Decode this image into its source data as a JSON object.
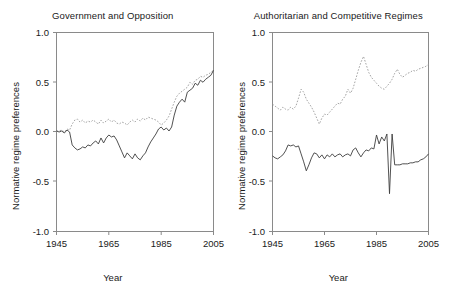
{
  "figure": {
    "xlabel": "Year",
    "ylabel": "Normative regime preferences"
  },
  "chart_data": [
    {
      "type": "line",
      "title": "Government and Opposition",
      "xlabel": "Year",
      "ylabel": "Normative regime preferences",
      "xlim": [
        1945,
        2005
      ],
      "ylim": [
        -1.0,
        1.0
      ],
      "xticks": [
        1945,
        1965,
        1985,
        2005
      ],
      "yticks": [
        -1.0,
        -0.5,
        0.0,
        0.5,
        1.0
      ],
      "xtick_labels": [
        "1945",
        "1965",
        "1985",
        "2005"
      ],
      "ytick_labels": [
        "-1.0",
        "-0.5",
        "0.0",
        "0.5",
        "1.0"
      ],
      "grid": false,
      "legend": "none",
      "x": [
        1945,
        1946,
        1947,
        1948,
        1949,
        1950,
        1951,
        1952,
        1953,
        1954,
        1955,
        1956,
        1957,
        1958,
        1959,
        1960,
        1961,
        1962,
        1963,
        1964,
        1965,
        1966,
        1967,
        1968,
        1969,
        1970,
        1971,
        1972,
        1973,
        1974,
        1975,
        1976,
        1977,
        1978,
        1979,
        1980,
        1981,
        1982,
        1983,
        1984,
        1985,
        1986,
        1987,
        1988,
        1989,
        1990,
        1991,
        1992,
        1993,
        1994,
        1995,
        1996,
        1997,
        1998,
        1999,
        2000,
        2001,
        2002,
        2003,
        2004,
        2005
      ],
      "series": [
        {
          "name": "Government (solid)",
          "style": "solid",
          "values": [
            0.01,
            0.0,
            0.01,
            -0.01,
            0.02,
            0.0,
            -0.13,
            -0.16,
            -0.18,
            -0.17,
            -0.15,
            -0.16,
            -0.13,
            -0.14,
            -0.11,
            -0.09,
            -0.12,
            -0.06,
            -0.11,
            -0.06,
            -0.03,
            -0.05,
            -0.04,
            -0.08,
            -0.14,
            -0.2,
            -0.26,
            -0.21,
            -0.24,
            -0.27,
            -0.22,
            -0.26,
            -0.28,
            -0.24,
            -0.21,
            -0.15,
            -0.1,
            -0.06,
            -0.02,
            0.03,
            0.05,
            0.02,
            0.04,
            0.01,
            0.05,
            0.17,
            0.26,
            0.3,
            0.33,
            0.3,
            0.4,
            0.42,
            0.44,
            0.49,
            0.47,
            0.52,
            0.5,
            0.53,
            0.55,
            0.57,
            0.62
          ]
        },
        {
          "name": "Opposition (dotted)",
          "style": "dotted",
          "values": [
            0.01,
            0.01,
            0.02,
            0.0,
            0.03,
            0.02,
            0.08,
            0.12,
            0.13,
            0.1,
            0.12,
            0.09,
            0.11,
            0.1,
            0.12,
            0.1,
            0.08,
            0.12,
            0.09,
            0.11,
            0.13,
            0.1,
            0.12,
            0.09,
            0.08,
            0.1,
            0.09,
            0.07,
            0.1,
            0.12,
            0.1,
            0.13,
            0.11,
            0.14,
            0.12,
            0.15,
            0.14,
            0.13,
            0.12,
            0.1,
            0.07,
            0.09,
            0.12,
            0.16,
            0.23,
            0.3,
            0.36,
            0.39,
            0.41,
            0.43,
            0.45,
            0.5,
            0.48,
            0.52,
            0.53,
            0.56,
            0.55,
            0.57,
            0.58,
            0.6,
            0.62
          ]
        }
      ]
    },
    {
      "type": "line",
      "title": "Authoritarian and Competitive Regimes",
      "xlabel": "Year",
      "ylabel": "Normative regime preferences",
      "xlim": [
        1945,
        2005
      ],
      "ylim": [
        -1.0,
        1.0
      ],
      "xticks": [
        1945,
        1965,
        1985,
        2005
      ],
      "yticks": [
        -1.0,
        -0.5,
        0.0,
        0.5,
        1.0
      ],
      "xtick_labels": [
        "1945",
        "1965",
        "1985",
        "2005"
      ],
      "ytick_labels": [
        "-1.0",
        "-0.5",
        "0.0",
        "0.5",
        "1.0"
      ],
      "grid": false,
      "legend": "none",
      "x": [
        1945,
        1946,
        1947,
        1948,
        1949,
        1950,
        1951,
        1952,
        1953,
        1954,
        1955,
        1956,
        1957,
        1958,
        1959,
        1960,
        1961,
        1962,
        1963,
        1964,
        1965,
        1966,
        1967,
        1968,
        1969,
        1970,
        1971,
        1972,
        1973,
        1974,
        1975,
        1976,
        1977,
        1978,
        1979,
        1980,
        1981,
        1982,
        1983,
        1984,
        1985,
        1986,
        1987,
        1988,
        1989,
        1990,
        1991,
        1992,
        1993,
        1994,
        1995,
        1996,
        1997,
        1998,
        1999,
        2000,
        2001,
        2002,
        2003,
        2004,
        2005
      ],
      "series": [
        {
          "name": "Authoritarian (solid)",
          "style": "solid",
          "values": [
            -0.24,
            -0.26,
            -0.27,
            -0.25,
            -0.23,
            -0.19,
            -0.13,
            -0.14,
            -0.13,
            -0.15,
            -0.14,
            -0.22,
            -0.3,
            -0.39,
            -0.33,
            -0.26,
            -0.21,
            -0.22,
            -0.26,
            -0.23,
            -0.27,
            -0.23,
            -0.25,
            -0.22,
            -0.25,
            -0.23,
            -0.22,
            -0.25,
            -0.23,
            -0.22,
            -0.24,
            -0.18,
            -0.16,
            -0.21,
            -0.25,
            -0.21,
            -0.18,
            -0.19,
            -0.16,
            -0.17,
            -0.03,
            -0.12,
            -0.05,
            -0.09,
            -0.02,
            -0.62,
            -0.02,
            -0.33,
            -0.33,
            -0.33,
            -0.32,
            -0.32,
            -0.32,
            -0.31,
            -0.31,
            -0.3,
            -0.3,
            -0.28,
            -0.27,
            -0.25,
            -0.22
          ]
        },
        {
          "name": "Competitive (dotted)",
          "style": "dotted",
          "values": [
            0.28,
            0.26,
            0.24,
            0.22,
            0.25,
            0.23,
            0.22,
            0.25,
            0.23,
            0.26,
            0.34,
            0.43,
            0.4,
            0.33,
            0.29,
            0.25,
            0.2,
            0.14,
            0.08,
            0.14,
            0.18,
            0.17,
            0.2,
            0.23,
            0.26,
            0.29,
            0.28,
            0.33,
            0.36,
            0.43,
            0.39,
            0.44,
            0.53,
            0.62,
            0.7,
            0.76,
            0.68,
            0.6,
            0.55,
            0.52,
            0.49,
            0.46,
            0.44,
            0.43,
            0.46,
            0.49,
            0.53,
            0.59,
            0.63,
            0.58,
            0.55,
            0.57,
            0.59,
            0.6,
            0.62,
            0.61,
            0.63,
            0.64,
            0.65,
            0.66,
            0.68
          ]
        }
      ]
    }
  ]
}
